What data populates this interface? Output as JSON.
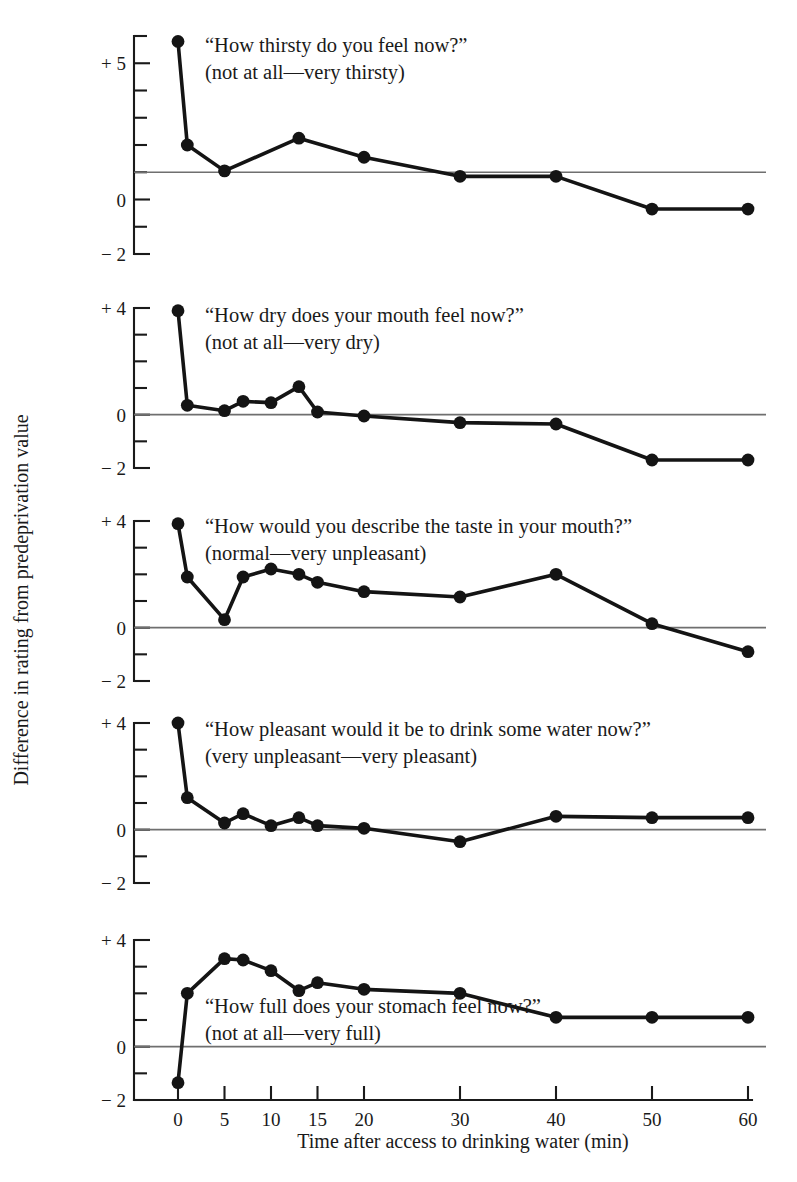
{
  "figure": {
    "y_axis_title": "Difference in rating from predeprivation value",
    "x_axis_title": "Time after access to drinking water (min)",
    "background_color": "#ffffff",
    "line_color": "#141414",
    "axis_color": "#1a1a1a",
    "reference_line_color": "#6f6f6f"
  },
  "chart_data": {
    "type": "line",
    "title": "",
    "xlabel": "Time after access to drinking water (min)",
    "ylabel": "Difference in rating from predeprivation value",
    "x": [
      0,
      1,
      5,
      7,
      10,
      13,
      15,
      20,
      30,
      40,
      50,
      60
    ],
    "x_tick_labels": [
      "0",
      "5",
      "10",
      "15",
      "20",
      "30",
      "40",
      "50",
      "60"
    ],
    "x_tick_values": [
      0,
      5,
      10,
      15,
      20,
      30,
      40,
      50,
      60
    ],
    "x_scale_note": "piecewise: 0-20 min spaced per 5 min, 20-60 min spaced per 10 min",
    "grid": false,
    "legend": "none",
    "panels": [
      {
        "id": "thirsty",
        "question": "“How thirsty do you feel now?”",
        "scale": "(not at all—very thirsty)",
        "ylim": [
          -2,
          6
        ],
        "y_tick_labels": [
          "+ 5",
          "0",
          "− 2"
        ],
        "y_tick_values": [
          5,
          0,
          -2
        ],
        "y_minor_ticks": [
          6,
          4,
          3,
          2,
          1,
          -1
        ],
        "reference_line_value": 1,
        "x": [
          0,
          1,
          5,
          13,
          20,
          30,
          40,
          50,
          60
        ],
        "values": [
          5.8,
          2.0,
          1.05,
          2.25,
          1.55,
          0.85,
          0.85,
          -0.35,
          -0.35
        ]
      },
      {
        "id": "dry-mouth",
        "question": "“How dry does your mouth feel now?”",
        "scale": "(not at all—very dry)",
        "ylim": [
          -2,
          4
        ],
        "y_tick_labels": [
          "+ 4",
          "0",
          "− 2"
        ],
        "y_tick_values": [
          4,
          0,
          -2
        ],
        "y_minor_ticks": [
          3,
          2,
          1,
          -1
        ],
        "reference_line_value": 0,
        "x": [
          0,
          1,
          5,
          7,
          10,
          13,
          15,
          20,
          30,
          40,
          50,
          60
        ],
        "values": [
          3.9,
          0.35,
          0.15,
          0.5,
          0.45,
          1.05,
          0.1,
          -0.05,
          -0.3,
          -0.35,
          -1.7,
          -1.7
        ]
      },
      {
        "id": "taste",
        "question": "“How would you describe the taste in your mouth?”",
        "scale": "(normal—very unpleasant)",
        "ylim": [
          -2,
          4
        ],
        "y_tick_labels": [
          "+ 4",
          "0",
          "− 2"
        ],
        "y_tick_values": [
          4,
          0,
          -2
        ],
        "y_minor_ticks": [
          3,
          2,
          1,
          -1
        ],
        "reference_line_value": 0,
        "x": [
          0,
          1,
          5,
          7,
          10,
          13,
          15,
          20,
          30,
          40,
          50,
          60
        ],
        "values": [
          3.9,
          1.9,
          0.3,
          1.9,
          2.2,
          2.0,
          1.7,
          1.35,
          1.15,
          2.0,
          0.15,
          -0.9
        ]
      },
      {
        "id": "pleasant-to-drink",
        "question": "“How pleasant would it be to drink some water now?”",
        "scale": "(very unpleasant—very pleasant)",
        "ylim": [
          -2,
          4
        ],
        "y_tick_labels": [
          "+ 4",
          "0",
          "− 2"
        ],
        "y_tick_values": [
          4,
          0,
          -2
        ],
        "y_minor_ticks": [
          3,
          2,
          1,
          -1
        ],
        "reference_line_value": 0,
        "x": [
          0,
          1,
          5,
          7,
          10,
          13,
          15,
          20,
          30,
          40,
          50,
          60
        ],
        "values": [
          4.0,
          1.2,
          0.25,
          0.6,
          0.15,
          0.45,
          0.15,
          0.05,
          -0.45,
          0.5,
          0.45,
          0.45
        ]
      },
      {
        "id": "stomach-full",
        "question": "“How full does your stomach feel now?”",
        "scale": "(not at all—very full)",
        "ylim": [
          -2,
          4
        ],
        "y_tick_labels": [
          "+ 4",
          "0",
          "− 2"
        ],
        "y_tick_values": [
          4,
          0,
          -2
        ],
        "y_minor_ticks": [
          3,
          2,
          1,
          -1
        ],
        "reference_line_value": 0,
        "x": [
          0,
          1,
          5,
          7,
          10,
          13,
          15,
          20,
          30,
          40,
          50,
          60
        ],
        "values": [
          -1.35,
          2.0,
          3.3,
          3.25,
          2.85,
          2.1,
          2.4,
          2.15,
          2.0,
          1.1,
          1.1,
          1.1
        ]
      }
    ]
  }
}
